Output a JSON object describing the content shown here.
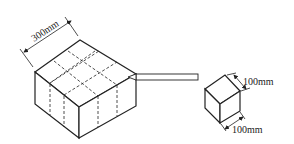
{
  "diagram": {
    "big_block": {
      "label": "300mm",
      "grid": "3x3"
    },
    "small_cube": {
      "label_top": "100mm",
      "label_bottom": "100mm"
    },
    "colors": {
      "line": "#222222",
      "background": "#ffffff"
    }
  }
}
